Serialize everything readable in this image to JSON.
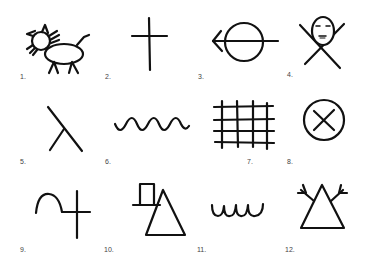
{
  "figure": {
    "stroke_color": "#111111",
    "label_color": "#444444",
    "symbols": [
      {
        "number": "1.",
        "icon": "cat-icon"
      },
      {
        "number": "2.",
        "icon": "cross-icon"
      },
      {
        "number": "3.",
        "icon": "arrow-through-circle-icon"
      },
      {
        "number": "4.",
        "icon": "face-with-x-icon"
      },
      {
        "number": "5.",
        "icon": "forked-lines-icon"
      },
      {
        "number": "6.",
        "icon": "wave-icon"
      },
      {
        "number": "7.",
        "icon": "grid-icon"
      },
      {
        "number": "8.",
        "icon": "circled-x-icon"
      },
      {
        "number": "9.",
        "icon": "arc-and-cross-icon"
      },
      {
        "number": "10.",
        "icon": "box-and-triangle-icon"
      },
      {
        "number": "11.",
        "icon": "loops-icon"
      },
      {
        "number": "12.",
        "icon": "triangle-with-branches-icon"
      }
    ]
  }
}
